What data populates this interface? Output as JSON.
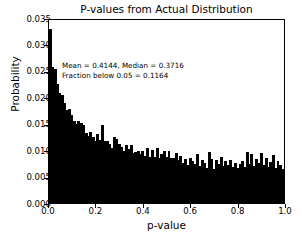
{
  "chart_data": {
    "type": "bar",
    "title": "P-values from Actual Distribution",
    "xlabel": "p-value",
    "ylabel": "Probability",
    "xlim": [
      0.0,
      1.0
    ],
    "ylim": [
      0.0,
      0.035
    ],
    "grid": false,
    "legend": null,
    "bin_width": 0.01,
    "bar_color": "#000000",
    "annotations": [
      "Mean = 0.4144, Median = 0.3716",
      "Fraction below 0.05 = 0.1164"
    ],
    "xticks": [
      "0.0",
      "0.2",
      "0.4",
      "0.6",
      "0.8",
      "1.0"
    ],
    "xtick_values": [
      0.0,
      0.2,
      0.4,
      0.6,
      0.8,
      1.0
    ],
    "yticks": [
      "0.000",
      "0.005",
      "0.010",
      "0.015",
      "0.020",
      "0.025",
      "0.030",
      "0.035"
    ],
    "ytick_values": [
      0.0,
      0.005,
      0.01,
      0.015,
      0.02,
      0.025,
      0.03,
      0.035
    ],
    "x": [
      0.005,
      0.015,
      0.025,
      0.035,
      0.045,
      0.055,
      0.065,
      0.075,
      0.085,
      0.095,
      0.105,
      0.115,
      0.125,
      0.135,
      0.145,
      0.155,
      0.165,
      0.175,
      0.185,
      0.195,
      0.205,
      0.215,
      0.225,
      0.235,
      0.245,
      0.255,
      0.265,
      0.275,
      0.285,
      0.295,
      0.305,
      0.315,
      0.325,
      0.335,
      0.345,
      0.355,
      0.365,
      0.375,
      0.385,
      0.395,
      0.405,
      0.415,
      0.425,
      0.435,
      0.445,
      0.455,
      0.465,
      0.475,
      0.485,
      0.495,
      0.505,
      0.515,
      0.525,
      0.535,
      0.545,
      0.555,
      0.565,
      0.575,
      0.585,
      0.595,
      0.605,
      0.615,
      0.625,
      0.635,
      0.645,
      0.655,
      0.665,
      0.675,
      0.685,
      0.695,
      0.705,
      0.715,
      0.725,
      0.735,
      0.745,
      0.755,
      0.765,
      0.775,
      0.785,
      0.795,
      0.805,
      0.815,
      0.825,
      0.835,
      0.845,
      0.855,
      0.865,
      0.875,
      0.885,
      0.895,
      0.905,
      0.915,
      0.925,
      0.935,
      0.945,
      0.955,
      0.965,
      0.975,
      0.985,
      0.995
    ],
    "values": [
      0.033,
      0.0258,
      0.0253,
      0.0225,
      0.0209,
      0.0204,
      0.019,
      0.0176,
      0.0177,
      0.0166,
      0.0156,
      0.0149,
      0.0155,
      0.0152,
      0.0147,
      0.0132,
      0.0127,
      0.0134,
      0.0125,
      0.0118,
      0.013,
      0.0119,
      0.0147,
      0.0118,
      0.0117,
      0.0111,
      0.0104,
      0.0124,
      0.0122,
      0.0112,
      0.0106,
      0.0098,
      0.011,
      0.0103,
      0.011,
      0.0095,
      0.0096,
      0.0098,
      0.0093,
      0.0098,
      0.0089,
      0.0104,
      0.0088,
      0.0101,
      0.0087,
      0.0104,
      0.0086,
      0.0092,
      0.0098,
      0.0088,
      0.0099,
      0.0086,
      0.0085,
      0.0094,
      0.0082,
      0.0089,
      0.0076,
      0.0083,
      0.0072,
      0.0085,
      0.008,
      0.0074,
      0.0092,
      0.007,
      0.0081,
      0.0076,
      0.0066,
      0.0097,
      0.0083,
      0.0065,
      0.0081,
      0.0073,
      0.0087,
      0.007,
      0.0079,
      0.0072,
      0.0081,
      0.0069,
      0.0076,
      0.0066,
      0.0073,
      0.008,
      0.0069,
      0.0096,
      0.0074,
      0.0092,
      0.007,
      0.0083,
      0.0076,
      0.0094,
      0.0071,
      0.0086,
      0.0069,
      0.0078,
      0.009,
      0.0067,
      0.0079,
      0.0071,
      0.0064,
      0.0074
    ]
  },
  "caption": {
    "text": ""
  }
}
